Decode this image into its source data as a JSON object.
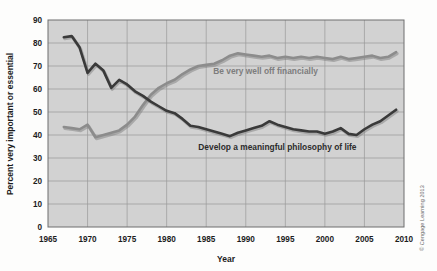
{
  "figure": {
    "credit": "© Cengage Learning 2013",
    "background_color": "#fdfdfc",
    "plot_background_color": "#d2d2d2",
    "grid_color": "#9a9a9a",
    "frame_color": "#6e6e6e"
  },
  "chart_data": {
    "type": "line",
    "title": "",
    "xlabel": "Year",
    "ylabel": "Percent very important or essential",
    "xlim": [
      1965,
      2010
    ],
    "ylim": [
      0,
      90
    ],
    "xticks": [
      1965,
      1970,
      1975,
      1980,
      1985,
      1990,
      1995,
      2000,
      2005,
      2010
    ],
    "yticks": [
      0,
      10,
      20,
      30,
      40,
      50,
      60,
      70,
      80,
      90
    ],
    "grid": true,
    "legend_position": "inline-annotations",
    "series": [
      {
        "name": "Be very well off financially",
        "color": "#8c8c8c",
        "label_color": "#7d7d7d",
        "label_x": 1992.5,
        "label_y": 66.5,
        "x": [
          1967,
          1968,
          1969,
          1970,
          1971,
          1972,
          1973,
          1974,
          1975,
          1976,
          1977,
          1978,
          1979,
          1980,
          1981,
          1982,
          1983,
          1984,
          1985,
          1986,
          1987,
          1988,
          1989,
          1990,
          1991,
          1992,
          1993,
          1994,
          1995,
          1996,
          1997,
          1998,
          1999,
          2000,
          2001,
          2002,
          2003,
          2004,
          2005,
          2006,
          2007,
          2008,
          2009
        ],
        "y": [
          43.5,
          43.0,
          42.5,
          44.5,
          39.0,
          40.0,
          41.0,
          42.0,
          44.5,
          48.0,
          53.0,
          57.5,
          60.5,
          62.5,
          64.0,
          66.5,
          68.5,
          70.0,
          70.5,
          71.0,
          72.5,
          74.5,
          75.5,
          75.0,
          74.5,
          74.0,
          74.5,
          73.5,
          74.0,
          73.5,
          74.0,
          73.5,
          74.0,
          73.5,
          73.0,
          74.0,
          73.0,
          73.5,
          74.0,
          74.5,
          73.5,
          74.0,
          76.0
        ]
      },
      {
        "name": "Develop a meaningful philosophy of life",
        "color": "#3a3a3a",
        "label_color": "#2c2c2c",
        "label_x": 1994.0,
        "label_y": 33.5,
        "x": [
          1967,
          1968,
          1969,
          1970,
          1971,
          1972,
          1973,
          1974,
          1975,
          1976,
          1977,
          1978,
          1979,
          1980,
          1981,
          1982,
          1983,
          1984,
          1985,
          1986,
          1987,
          1988,
          1989,
          1990,
          1991,
          1992,
          1993,
          1994,
          1995,
          1996,
          1997,
          1998,
          1999,
          2000,
          2001,
          2002,
          2003,
          2004,
          2005,
          2006,
          2007,
          2008,
          2009
        ],
        "y": [
          82.5,
          83.0,
          78.0,
          67.0,
          71.0,
          68.0,
          60.5,
          64.0,
          62.0,
          59.0,
          57.0,
          54.5,
          52.5,
          50.5,
          49.5,
          47.0,
          44.0,
          43.5,
          42.5,
          41.5,
          40.5,
          39.5,
          41.0,
          42.0,
          43.0,
          44.0,
          46.0,
          44.5,
          43.5,
          42.5,
          42.0,
          41.5,
          41.5,
          40.5,
          41.5,
          43.0,
          40.5,
          40.0,
          42.5,
          44.5,
          46.0,
          48.5,
          51.0
        ]
      }
    ]
  }
}
